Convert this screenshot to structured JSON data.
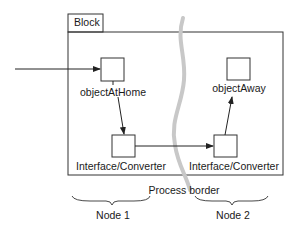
{
  "diagram": {
    "block_label": "Block",
    "objects": [
      {
        "id": "home",
        "label": "objectAtHome"
      },
      {
        "id": "away",
        "label": "objectAway"
      }
    ],
    "converters": [
      {
        "id": "conv1",
        "label": "Interface/Converter"
      },
      {
        "id": "conv2",
        "label": "Interface/Converter"
      }
    ],
    "process_border_label": "Process border",
    "nodes": [
      {
        "label": "Node 1"
      },
      {
        "label": "Node 2"
      }
    ],
    "edges": [
      {
        "from": "external",
        "to": "home"
      },
      {
        "from": "home",
        "to": "conv1"
      },
      {
        "from": "conv1",
        "to": "conv2"
      },
      {
        "from": "conv2",
        "to": "away"
      }
    ],
    "colors": {
      "line": "#222222",
      "process_border": "#c8c8c8"
    }
  }
}
